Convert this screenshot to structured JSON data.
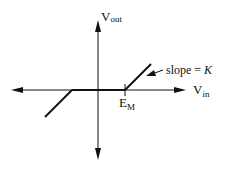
{
  "diagram": {
    "axes": {
      "y_label_main": "V",
      "y_label_sub": "out",
      "x_label_main": "V",
      "x_label_sub": "in"
    },
    "threshold": {
      "label_main": "E",
      "label_sub": "M"
    },
    "annotation": {
      "prefix": "slope = ",
      "symbol": "K"
    },
    "colors": {
      "line": "#111111",
      "background": "#ffffff"
    }
  }
}
